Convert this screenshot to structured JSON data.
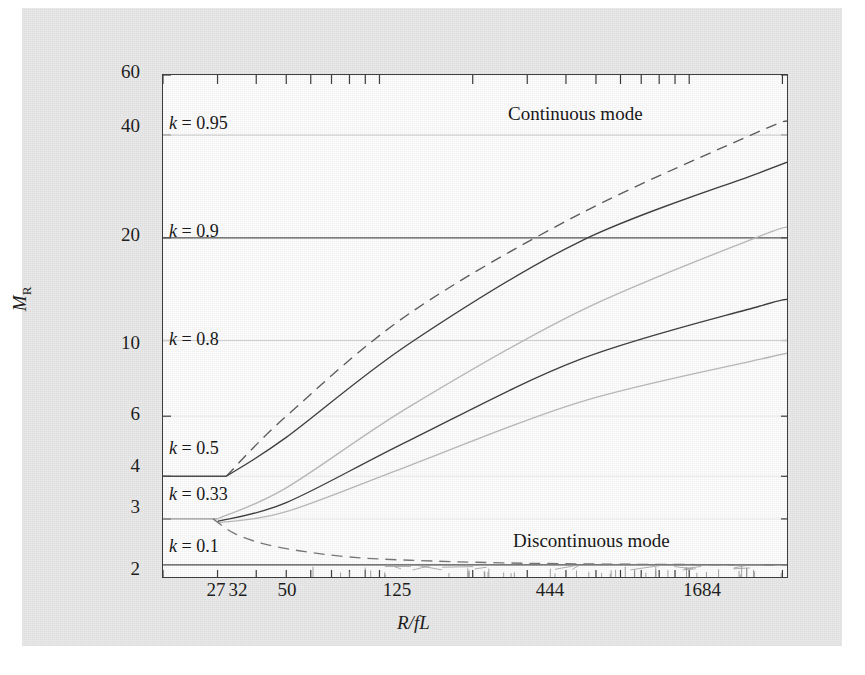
{
  "figure": {
    "background_color": "#e9e9e9",
    "canvas_color": "#fdfdfd",
    "frame_color": "#3a3a3a"
  },
  "chart_data": {
    "type": "line",
    "title": "",
    "xlabel": "R/fL",
    "ylabel": "M_R",
    "xscale": "log",
    "yscale": "log",
    "xlim": [
      20,
      2100
    ],
    "ylim": [
      2,
      60
    ],
    "grid": true,
    "xticks": [
      27,
      32,
      50,
      125,
      444,
      1684
    ],
    "xticklabels": [
      "27",
      "32",
      "50",
      "125",
      "444",
      "1684"
    ],
    "yticks": [
      2,
      3,
      4,
      6,
      10,
      20,
      40,
      60
    ],
    "yticklabels": [
      "2",
      "3",
      "4",
      "6",
      "10",
      "20",
      "40",
      "60"
    ],
    "annotations": [
      {
        "text": "Continuous mode",
        "x": 420,
        "y": 46
      },
      {
        "text": "Discontinuous mode",
        "x": 420,
        "y": 2.45
      }
    ],
    "series": [
      {
        "name": "k = 0.95",
        "label": "k = 0.95",
        "style": "dotted",
        "color": "#d8d8d8",
        "level": 40,
        "points": [
          [
            20,
            40
          ],
          [
            2100,
            40
          ]
        ]
      },
      {
        "name": "k = 0.9",
        "label": "k = 0.9",
        "style": "solid",
        "color": "#555555",
        "level": 20,
        "points": [
          [
            20,
            20
          ],
          [
            2100,
            20
          ]
        ]
      },
      {
        "name": "k = 0.8",
        "label": "k = 0.8",
        "style": "dotted",
        "color": "#cfcfcf",
        "level": 10,
        "points": [
          [
            20,
            10
          ],
          [
            2100,
            10
          ]
        ]
      },
      {
        "name": "k = 0.5",
        "label": "k = 0.5",
        "style": "solid",
        "color": "#4a4a4a",
        "level": 4,
        "points": [
          [
            20,
            4
          ],
          [
            32,
            4
          ]
        ]
      },
      {
        "name": "k = 0.33",
        "label": "k = 0.33",
        "style": "solid",
        "color": "#9a9a9a",
        "level": 3,
        "points": [
          [
            20,
            3
          ],
          [
            30,
            3
          ]
        ]
      },
      {
        "name": "k = 0.1",
        "label": "k = 0.1",
        "style": "solid",
        "color": "#4a4a4a",
        "level": 2.2,
        "points": [
          [
            20,
            2.2
          ],
          [
            2100,
            2.2
          ]
        ]
      },
      {
        "name": "boundary-dashed-upper",
        "label": "",
        "style": "dashed",
        "color": "#5a5a5a",
        "points": [
          [
            32,
            4
          ],
          [
            50,
            6.0
          ],
          [
            125,
            12.0
          ],
          [
            444,
            23.5
          ],
          [
            1684,
            41.0
          ],
          [
            2100,
            44.0
          ]
        ]
      },
      {
        "name": "boundary-solid-upper",
        "label": "",
        "style": "solid",
        "color": "#3c3c3c",
        "points": [
          [
            32,
            4
          ],
          [
            50,
            5.2
          ],
          [
            125,
            9.8
          ],
          [
            444,
            19.5
          ],
          [
            1684,
            31.0
          ],
          [
            2100,
            33.5
          ]
        ]
      },
      {
        "name": "boundary-grey-mid",
        "label": "",
        "style": "solid",
        "color": "#b9b9b9",
        "points": [
          [
            30,
            3.0
          ],
          [
            50,
            3.7
          ],
          [
            125,
            6.4
          ],
          [
            444,
            12.2
          ],
          [
            1684,
            20.2
          ],
          [
            2100,
            21.5
          ]
        ]
      },
      {
        "name": "boundary-solid-lower",
        "label": "",
        "style": "solid",
        "color": "#3c3c3c",
        "points": [
          [
            30,
            2.95
          ],
          [
            50,
            3.35
          ],
          [
            125,
            5.1
          ],
          [
            444,
            8.8
          ],
          [
            1684,
            12.6
          ],
          [
            2100,
            13.2
          ]
        ]
      },
      {
        "name": "boundary-grey-lower",
        "label": "",
        "style": "solid",
        "color": "#b9b9b9",
        "points": [
          [
            30,
            2.92
          ],
          [
            50,
            3.15
          ],
          [
            125,
            4.3
          ],
          [
            444,
            6.6
          ],
          [
            1684,
            8.8
          ],
          [
            2100,
            9.2
          ]
        ]
      },
      {
        "name": "boundary-dashed-descending",
        "label": "",
        "style": "dashed",
        "color": "#777777",
        "points": [
          [
            29,
            3.0
          ],
          [
            34,
            2.72
          ],
          [
            42,
            2.54
          ],
          [
            55,
            2.42
          ],
          [
            80,
            2.32
          ],
          [
            125,
            2.27
          ],
          [
            250,
            2.23
          ],
          [
            600,
            2.21
          ],
          [
            2100,
            2.2
          ]
        ]
      }
    ]
  },
  "klabels": [
    {
      "text_prefix": "k",
      "text_body": " = 0.95"
    },
    {
      "text_prefix": "k",
      "text_body": " = 0.9"
    },
    {
      "text_prefix": "k",
      "text_body": " = 0.8"
    },
    {
      "text_prefix": "k",
      "text_body": " = 0.5"
    },
    {
      "text_prefix": "k",
      "text_body": " = 0.33"
    },
    {
      "text_prefix": "k",
      "text_body": " = 0.1"
    }
  ],
  "axis": {
    "y_title_main": "M",
    "y_title_sub": "R",
    "x_title": "R/fL"
  }
}
